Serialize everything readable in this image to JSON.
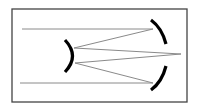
{
  "diagram": {
    "type": "cassegrain-telescope-ray-diagram",
    "colors": {
      "frame": "#444444",
      "ray": "#8a8a8a",
      "mirror": "#000000",
      "background": "#ffffff"
    },
    "frame": {
      "x": 12,
      "y": 9,
      "width": 175,
      "height": 93
    },
    "incoming_rays": [
      {
        "from": [
          22,
          29
        ],
        "to": [
          153,
          29
        ]
      },
      {
        "from": [
          20,
          83
        ],
        "to": [
          153,
          83
        ]
      }
    ],
    "reflected_rays": [
      {
        "from": [
          153,
          29
        ],
        "to": [
          74,
          48
        ]
      },
      {
        "from": [
          153,
          83
        ],
        "to": [
          75,
          63
        ]
      },
      {
        "from": [
          74,
          48
        ],
        "to": [
          181,
          54
        ]
      },
      {
        "from": [
          75,
          63
        ],
        "to": [
          181,
          54
        ]
      }
    ],
    "mirrors": [
      {
        "name": "secondary-mirror",
        "path": "M65,40 Q80,56 65,72"
      },
      {
        "name": "primary-mirror-upper",
        "path": "M151,20 Q162,28 166,44"
      },
      {
        "name": "primary-mirror-lower",
        "path": "M166,66 Q162,82 151,90"
      }
    ],
    "focal_point": [
      181,
      54
    ]
  }
}
